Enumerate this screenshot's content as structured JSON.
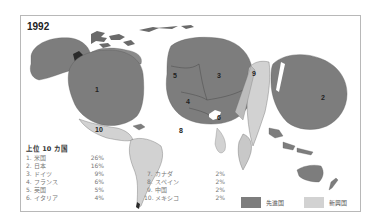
{
  "map": {
    "year": "1992",
    "colors": {
      "developed": "#7d7d7d",
      "emerging": "#d2d2d2",
      "border": "#5a5a5a",
      "frame": "#b8b8b8"
    },
    "region_labels": [
      "1",
      "2",
      "3",
      "4",
      "5",
      "6",
      "8",
      "9",
      "10"
    ]
  },
  "ranking": {
    "title": "上位 10 カ国",
    "items": [
      {
        "rank": "1.",
        "country": "米国",
        "share": "26%"
      },
      {
        "rank": "2.",
        "country": "日本",
        "share": "16%"
      },
      {
        "rank": "3.",
        "country": "ドイツ",
        "share": "9%"
      },
      {
        "rank": "4.",
        "country": "フランス",
        "share": "6%"
      },
      {
        "rank": "5.",
        "country": "英国",
        "share": "5%"
      },
      {
        "rank": "6.",
        "country": "イタリア",
        "share": "4%"
      },
      {
        "rank": "7.",
        "country": "カナダ",
        "share": "2%"
      },
      {
        "rank": "8.",
        "country": "スペイン",
        "share": "2%"
      },
      {
        "rank": "9.",
        "country": "中国",
        "share": "2%"
      },
      {
        "rank": "10.",
        "country": "メキシコ",
        "share": "2%"
      }
    ]
  },
  "legend": {
    "developed_label": "先進国",
    "emerging_label": "新興国"
  }
}
